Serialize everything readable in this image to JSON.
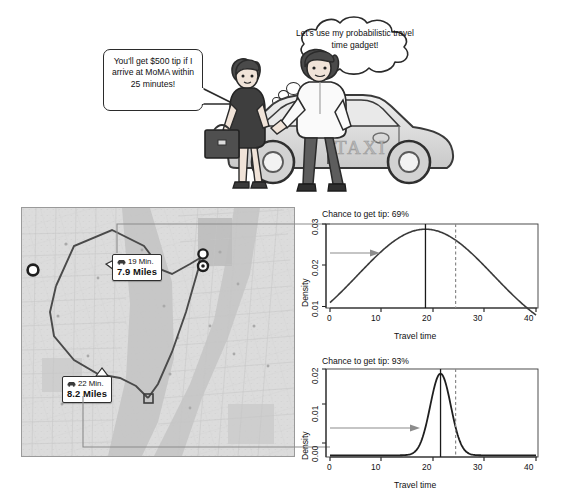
{
  "cartoon": {
    "speech_bubble": {
      "text": "You'll get $500 tip if I arrive at MoMA within 25 minutes!",
      "speaker": "passenger"
    },
    "thought_bubble": {
      "text": "Let's use my probabilistic travel time gadget!",
      "speaker": "driver"
    },
    "taxi_label": "TAXI"
  },
  "map": {
    "route_a": {
      "time": "19 Min.",
      "distance": "7.9 Miles",
      "icon": "car-icon"
    },
    "route_b": {
      "time": "22 Min.",
      "distance": "8.2 Miles",
      "icon": "car-icon"
    }
  },
  "chart_data": [
    {
      "id": "top",
      "type": "line",
      "title": "Chance to get tip: 69%",
      "xlabel": "Travel time",
      "ylabel": "Density",
      "xlim": [
        0,
        41
      ],
      "ylim": [
        0.0095,
        0.0305
      ],
      "xticks": [
        0,
        10,
        20,
        30,
        40
      ],
      "yticks": [
        0.01,
        0.02,
        0.03
      ],
      "ytick_labels": [
        "0.01",
        "0.02",
        "0.03"
      ],
      "curve": {
        "distribution": "normal",
        "mean": 19,
        "sd": 13.5,
        "peak_density": 0.0292
      },
      "mean_line": 19,
      "deadline_line": 25,
      "grid": false,
      "legend": "none",
      "annotation_arrow": {
        "from_route": "route_a",
        "points_to_curve": true
      },
      "x": [
        0,
        2,
        4,
        6,
        8,
        10,
        12,
        14,
        16,
        18,
        19,
        20,
        22,
        24,
        26,
        28,
        30,
        32,
        34,
        36,
        38,
        40
      ],
      "y": [
        0.0123,
        0.0144,
        0.0167,
        0.0192,
        0.0217,
        0.024,
        0.0261,
        0.0278,
        0.0288,
        0.0292,
        0.0292,
        0.0291,
        0.0285,
        0.0273,
        0.0256,
        0.0235,
        0.0212,
        0.0188,
        0.0164,
        0.0142,
        0.0121,
        0.0103
      ]
    },
    {
      "id": "bottom",
      "type": "line",
      "title": "Chance to get tip: 93%",
      "xlabel": "Travel time",
      "ylabel": "Density",
      "xlim": [
        0,
        41
      ],
      "ylim": [
        -0.0004,
        0.0205
      ],
      "xticks": [
        0,
        10,
        20,
        30,
        40
      ],
      "yticks": [
        0.0,
        0.01,
        0.02
      ],
      "ytick_labels": [
        "0.00",
        "0.01",
        "0.02"
      ],
      "curve": {
        "distribution": "normal",
        "mean": 22,
        "sd": 2.05,
        "peak_density": 0.0194
      },
      "mean_line": 22,
      "deadline_line": 25,
      "grid": false,
      "legend": "none",
      "annotation_arrow": {
        "from_route": "route_b",
        "points_to_curve": true
      },
      "x": [
        0,
        4,
        8,
        12,
        14,
        16,
        17,
        18,
        19,
        20,
        21,
        22,
        23,
        24,
        25,
        26,
        27,
        28,
        30,
        34,
        38,
        40
      ],
      "y": [
        0.0,
        0.0,
        0.0,
        0.0,
        0.0001,
        0.0008,
        0.002,
        0.0043,
        0.0082,
        0.0132,
        0.0176,
        0.0194,
        0.0176,
        0.0132,
        0.0082,
        0.0043,
        0.002,
        0.0008,
        0.0001,
        0.0,
        0.0,
        0.0
      ]
    }
  ],
  "colors": {
    "axis": "#1a1a1a",
    "curve": "#303030",
    "mean_line": "#1a1a1a",
    "deadline_line": "#8a8a8a",
    "arrow": "#7d7d7d",
    "map_base": "#d5d5d5",
    "map_route": "#4a4a4a"
  }
}
